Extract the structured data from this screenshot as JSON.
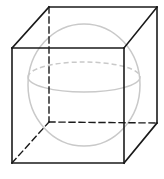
{
  "figure": {
    "background_color": "#ffffff",
    "canvas": {
      "width": 164,
      "height": 179
    },
    "cube": {
      "label": "cube",
      "edge_color_visible": "#1a1a1a",
      "edge_color_hidden": "#1a1a1a",
      "edge_width_visible": 1.6,
      "edge_width_hidden": 1.4,
      "hidden_dash_pattern": "6,4",
      "vertices": {
        "front_top_left": {
          "x": 12,
          "y": 48
        },
        "front_top_right": {
          "x": 124,
          "y": 48
        },
        "front_bottom_right": {
          "x": 124,
          "y": 163
        },
        "front_bottom_left": {
          "x": 12,
          "y": 163
        },
        "back_top_left": {
          "x": 49,
          "y": 7
        },
        "back_top_right": {
          "x": 157,
          "y": 7
        },
        "back_bottom_right": {
          "x": 157,
          "y": 123
        },
        "back_bottom_left": {
          "x": 49,
          "y": 122
        }
      },
      "visible_edges": [
        {
          "name": "front-top-edge",
          "x1": 12,
          "y1": 48,
          "x2": 124,
          "y2": 48
        },
        {
          "name": "front-right-edge",
          "x1": 124,
          "y1": 48,
          "x2": 124,
          "y2": 163
        },
        {
          "name": "front-bottom-edge",
          "x1": 124,
          "y1": 163,
          "x2": 12,
          "y2": 163
        },
        {
          "name": "front-left-edge",
          "x1": 12,
          "y1": 163,
          "x2": 12,
          "y2": 48
        },
        {
          "name": "back-top-edge",
          "x1": 49,
          "y1": 7,
          "x2": 157,
          "y2": 7
        },
        {
          "name": "back-right-edge",
          "x1": 157,
          "y1": 7,
          "x2": 157,
          "y2": 123
        },
        {
          "name": "top-left-connector",
          "x1": 12,
          "y1": 48,
          "x2": 49,
          "y2": 7
        },
        {
          "name": "top-right-connector",
          "x1": 124,
          "y1": 48,
          "x2": 157,
          "y2": 7
        },
        {
          "name": "bottom-right-connector",
          "x1": 124,
          "y1": 163,
          "x2": 157,
          "y2": 123
        }
      ],
      "hidden_edges": [
        {
          "name": "back-left-edge",
          "x1": 49,
          "y1": 7,
          "x2": 49,
          "y2": 122
        },
        {
          "name": "back-bottom-edge",
          "x1": 49,
          "y1": 122,
          "x2": 157,
          "y2": 123
        },
        {
          "name": "bottom-left-connector",
          "x1": 12,
          "y1": 163,
          "x2": 49,
          "y2": 122
        }
      ]
    },
    "sphere": {
      "label": "inscribed sphere",
      "stroke_color": "#c9c9c9",
      "stroke_width": 1.5,
      "fill": "none",
      "outline": {
        "cx": 84,
        "cy": 85,
        "rx": 56,
        "ry": 61
      },
      "equator": {
        "cx": 84,
        "cy": 77,
        "rx": 56,
        "ry": 15,
        "front_arc_style": "solid",
        "back_arc_style": "dashed",
        "back_dash_pattern": "5,3"
      }
    }
  }
}
